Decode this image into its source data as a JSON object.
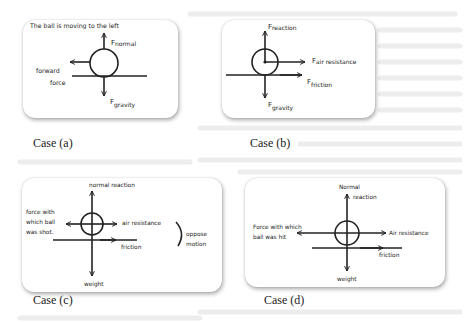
{
  "figure": {
    "cases": [
      {
        "id": "a",
        "caption": "Case (a)",
        "note": "The ball is moving to the left",
        "labels": {
          "normal": {
            "base": "F",
            "sub": "normal"
          },
          "gravity": {
            "base": "F",
            "sub": "gravity"
          },
          "forward_line1": "forward",
          "forward_line2": "force"
        }
      },
      {
        "id": "b",
        "caption": "Case (b)",
        "labels": {
          "reaction": {
            "base": "F",
            "sub": "reaction"
          },
          "air_resistance": {
            "base": "F",
            "sub": "air resistance"
          },
          "friction": {
            "base": "F",
            "sub": "friction"
          },
          "gravity": {
            "base": "F",
            "sub": "gravity"
          }
        }
      },
      {
        "id": "c",
        "caption": "Case (c)",
        "labels": {
          "normal_reaction": "normal reaction",
          "shot_line1": "force with",
          "shot_line2": "which ball",
          "shot_line3": "was shot.",
          "air_resistance": "air resistance",
          "friction": "friction",
          "oppose_line1": "oppose",
          "oppose_line2": "motion",
          "weight": "weight"
        }
      },
      {
        "id": "d",
        "caption": "Case (d)",
        "labels": {
          "normal_line1": "Normal",
          "normal_line2": "reaction",
          "hit_line1": "Force with which",
          "hit_line2": "ball was hit",
          "air_resistance": "Air resistance",
          "friction": "friction",
          "weight": "weight"
        }
      }
    ]
  },
  "colors": {
    "ink": "#222222",
    "ghost_text": "#ececec"
  }
}
